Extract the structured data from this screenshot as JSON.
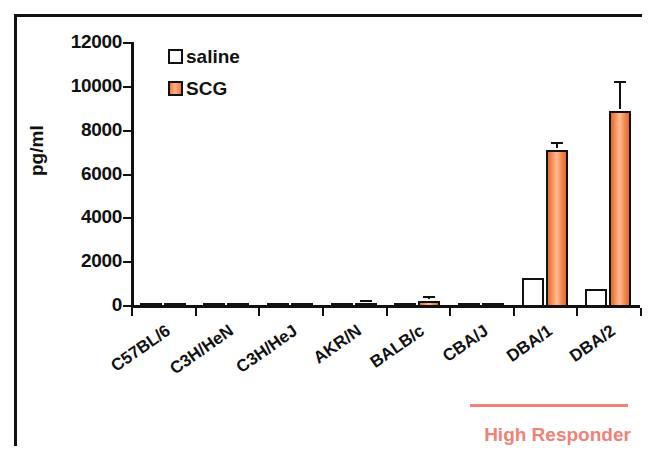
{
  "figure": {
    "ylabel": "pg/ml",
    "annotation": {
      "label": "High Responder",
      "color": "#ef8276"
    }
  },
  "legend": {
    "items": [
      {
        "label": "saline",
        "key": "saline",
        "color": "#ffffff"
      },
      {
        "label": "SCG",
        "key": "scg",
        "color": "#f5894f"
      }
    ]
  },
  "chart_data": {
    "type": "bar",
    "title": "",
    "xlabel": "",
    "ylabel": "pg/ml",
    "ylim": [
      0,
      12000
    ],
    "yticks": [
      0,
      2000,
      4000,
      6000,
      8000,
      10000,
      12000
    ],
    "ytick_labels": [
      "0",
      "2000",
      "4000",
      "6000",
      "8000",
      "10000",
      "12000"
    ],
    "grid": false,
    "legend_position": "top-left-inside",
    "categories": [
      "C57BL/6",
      "C3H/HeN",
      "C3H/HeJ",
      "AKR/N",
      "BALB/c",
      "CBA/J",
      "DBA/1",
      "DBA/2"
    ],
    "series": [
      {
        "name": "saline",
        "color": "#ffffff",
        "values": [
          20,
          20,
          20,
          30,
          30,
          20,
          1320,
          800
        ],
        "errors": [
          0,
          0,
          0,
          0,
          0,
          0,
          0,
          0
        ]
      },
      {
        "name": "SCG",
        "color": "#f5894f",
        "values": [
          20,
          25,
          25,
          170,
          280,
          30,
          7150,
          8950
        ],
        "errors": [
          0,
          0,
          0,
          40,
          110,
          0,
          270,
          1250
        ]
      }
    ],
    "annotations": [
      {
        "text": "High Responder",
        "color": "#ef8276",
        "spans_categories": [
          "DBA/1",
          "DBA/2"
        ]
      }
    ]
  }
}
